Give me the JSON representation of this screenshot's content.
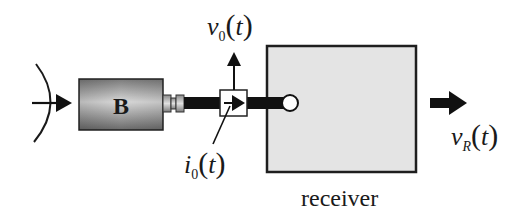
{
  "diagram": {
    "blocks": {
      "source_block": {
        "label": "B"
      },
      "receiver": {
        "label": "receiver"
      }
    },
    "labels": {
      "v0": {
        "var": "v",
        "sub": "0",
        "arg": "t",
        "open": "(",
        "close": ")"
      },
      "i0": {
        "var": "i",
        "sub": "0",
        "arg": "t",
        "open": "(",
        "close": ")"
      },
      "vR": {
        "var": "v",
        "sub": "R",
        "arg": "t",
        "open": "(",
        "close": ")"
      }
    },
    "colors": {
      "line": "#111111",
      "receiver_fill": "#e4e4e4",
      "block_gradient_dark": "#6e6e6e",
      "block_gradient_light": "#dcdcdc"
    }
  }
}
